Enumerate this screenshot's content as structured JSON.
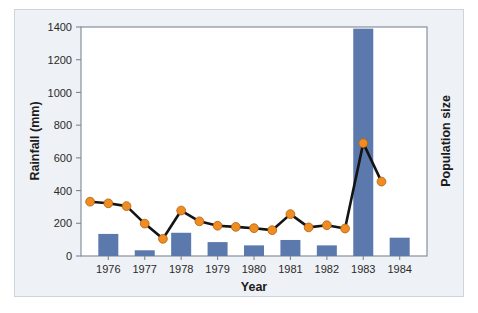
{
  "figure": {
    "background_color": "#eef1f5",
    "panel_border_color": "#cdd4dc",
    "plot_background": "#ffffff",
    "plot_frame_color": "#7d8794"
  },
  "chart_data": {
    "type": "bar",
    "title": "",
    "xlabel": "Year",
    "ylabel": "Rainfall (mm)",
    "y2label": "Population size",
    "ylim": [
      0,
      1400
    ],
    "yticks": [
      0,
      200,
      400,
      600,
      800,
      1000,
      1200,
      1400
    ],
    "ytick_labels": [
      "0",
      "200",
      "400",
      "600",
      "800",
      "1000",
      "1200",
      "1400"
    ],
    "categories": [
      "1976",
      "1977",
      "1978",
      "1979",
      "1980",
      "1981",
      "1982",
      "1983",
      "1984"
    ],
    "xtick_labels": [
      "1976",
      "1977",
      "1978",
      "1979",
      "1980",
      "1981",
      "1982",
      "1983",
      "1984"
    ],
    "grid": false,
    "legend": "none",
    "series": [
      {
        "name": "Rainfall (mm)",
        "type": "bar",
        "color": "#5b79ac",
        "x": [
          "1976",
          "1977",
          "1978",
          "1979",
          "1980",
          "1981",
          "1982",
          "1983",
          "1984"
        ],
        "values": [
          135,
          35,
          142,
          85,
          65,
          98,
          65,
          1390,
          112
        ]
      },
      {
        "name": "Population size",
        "type": "line",
        "line_color": "#141414",
        "marker_color": "#ef8d22",
        "marker_edge_color": "#b35f10",
        "x": [
          1975.5,
          1976.0,
          1976.5,
          1977.0,
          1977.5,
          1978.0,
          1978.5,
          1979.0,
          1979.5,
          1980.0,
          1980.5,
          1981.0,
          1981.5,
          1982.0,
          1982.5,
          1983.0,
          1983.5
        ],
        "values": [
          332,
          322,
          305,
          198,
          105,
          278,
          212,
          185,
          178,
          170,
          158,
          256,
          175,
          188,
          168,
          690,
          455
        ]
      }
    ]
  }
}
